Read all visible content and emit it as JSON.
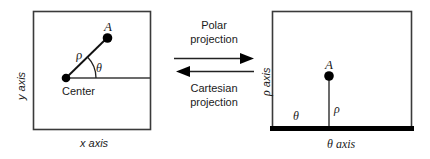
{
  "figure": {
    "left_panel": {
      "name": "cartesian-plane",
      "x_axis_label": "x axis",
      "y_axis_label": "y axis",
      "center_label": "Center",
      "point_label": "A",
      "radius_label": "ρ",
      "angle_label": "θ"
    },
    "right_panel": {
      "name": "polar-plane",
      "x_axis_label": "θ axis",
      "y_axis_label": "ρ axis",
      "point_label": "A",
      "radius_label": "ρ",
      "angle_label": "θ"
    },
    "middle": {
      "forward_line1": "Polar",
      "forward_line2": "projection",
      "backward_line1": "Cartesian",
      "backward_line2": "projection",
      "forward_arrow_direction": "right",
      "backward_arrow_direction": "left"
    },
    "colors": {
      "stroke": "#333333",
      "fill": "#000000",
      "background": "#ffffff",
      "text": "#1a1a1a"
    }
  }
}
